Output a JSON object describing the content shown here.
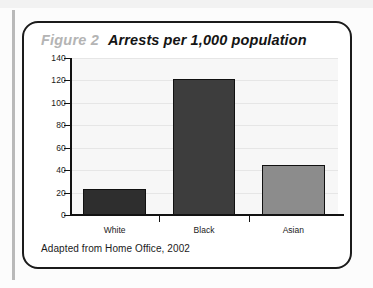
{
  "figure": {
    "number_label": "Figure 2",
    "heading": "Arrests per 1,000 population",
    "caption": "Adapted from Home Office, 2002"
  },
  "chart_data": {
    "type": "bar",
    "title": "Arrests per 1,000 population",
    "xlabel": "",
    "ylabel": "",
    "categories": [
      "White",
      "Black",
      "Asian"
    ],
    "values": [
      23,
      121,
      45
    ],
    "bar_colors": [
      "#2e2e2e",
      "#3d3d3d",
      "#8c8c8c"
    ],
    "ylim": [
      0,
      140
    ],
    "yticks": [
      0,
      20,
      40,
      60,
      80,
      100,
      120,
      140
    ],
    "ytick_labels": [
      "0",
      "20",
      "40",
      "60",
      "80",
      "100",
      "120",
      "140"
    ],
    "grid": true,
    "legend": "none",
    "source_note": "Adapted from Home Office, 2002"
  },
  "style": {
    "frame_color": "#1b1b1b",
    "plot_background": "#f7f7f7",
    "gridline_color": "#e6e6e6",
    "figure_number_color": "#b4b4b4",
    "heading_color": "#141414"
  }
}
